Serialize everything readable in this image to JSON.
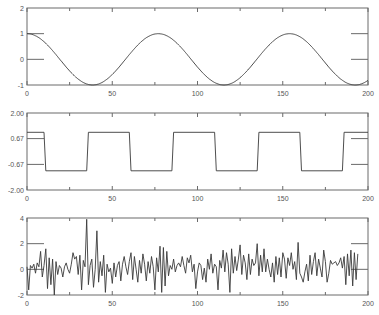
{
  "figure": {
    "background": "#ffffff",
    "frame_color": "#6a6a6a",
    "line_color": "#3a3a3a"
  },
  "chart_data": [
    {
      "type": "line",
      "title": "",
      "xlabel": "",
      "ylabel": "",
      "xlim": [
        0,
        200
      ],
      "ylim": [
        -1,
        2
      ],
      "x_ticks": [
        0,
        50,
        100,
        150,
        200
      ],
      "x_tick_labels": [
        "0",
        "50",
        "100",
        "150",
        "200"
      ],
      "y_ticks": [
        -1,
        0,
        1,
        2
      ],
      "y_tick_labels": [
        "-1",
        "0",
        "1",
        "2"
      ],
      "grid": false,
      "legend": null,
      "series": [
        {
          "name": "cosine",
          "function": "cos(2*pi*x/77)",
          "amplitude": 1,
          "period": 77,
          "x": [
            0,
            19,
            38,
            58,
            77,
            96,
            115,
            135,
            154,
            173,
            192,
            200
          ],
          "values": [
            1,
            0,
            -1,
            0,
            1,
            0,
            -1,
            0,
            1,
            0,
            -1,
            -0.8
          ]
        }
      ]
    },
    {
      "type": "line",
      "title": "",
      "xlabel": "",
      "ylabel": "",
      "xlim": [
        0,
        200
      ],
      "ylim": [
        -2,
        2
      ],
      "x_ticks": [
        0,
        50,
        100,
        150,
        200
      ],
      "x_tick_labels": [
        "0",
        "50",
        "100",
        "150",
        "200"
      ],
      "y_ticks": [
        -2,
        -0.67,
        0.67,
        2
      ],
      "y_tick_labels": [
        "-2.00",
        "-0.67",
        "0.67",
        "2.00"
      ],
      "grid": false,
      "legend": null,
      "series": [
        {
          "name": "square",
          "high": 1,
          "low": -1,
          "period": 50,
          "x": [
            0,
            10,
            11,
            35,
            36,
            60,
            61,
            85,
            86,
            110,
            111,
            135,
            136,
            160,
            161,
            185,
            186,
            200
          ],
          "values": [
            1,
            1,
            -1,
            -1,
            1,
            1,
            -1,
            -1,
            1,
            1,
            -1,
            -1,
            1,
            1,
            -1,
            -1,
            1,
            1
          ]
        }
      ]
    },
    {
      "type": "line",
      "title": "",
      "xlabel": "",
      "ylabel": "",
      "xlim": [
        0,
        200
      ],
      "ylim": [
        -2,
        4
      ],
      "x_ticks": [
        0,
        50,
        100,
        150,
        200
      ],
      "x_tick_labels": [
        "0",
        "50",
        "100",
        "150",
        "200"
      ],
      "y_ticks": [
        -2,
        0,
        2,
        4
      ],
      "y_tick_labels": [
        "-2",
        "0",
        "2",
        "4"
      ],
      "grid": false,
      "legend": null,
      "series": [
        {
          "name": "noise",
          "x": [
            0,
            1,
            2,
            3,
            4,
            5,
            6,
            7,
            8,
            9,
            10,
            11,
            12,
            13,
            14,
            15,
            16,
            17,
            18,
            19,
            20,
            21,
            22,
            23,
            24,
            25,
            26,
            27,
            28,
            29,
            30,
            31,
            32,
            33,
            34,
            35,
            36,
            37,
            38,
            39,
            40,
            41,
            42,
            43,
            44,
            45,
            46,
            47,
            48,
            49,
            50,
            51,
            52,
            53,
            54,
            55,
            56,
            57,
            58,
            59,
            60,
            61,
            62,
            63,
            64,
            65,
            66,
            67,
            68,
            69,
            70,
            71,
            72,
            73,
            74,
            75,
            76,
            77,
            78,
            79,
            80,
            81,
            82,
            83,
            84,
            85,
            86,
            87,
            88,
            89,
            90,
            91,
            92,
            93,
            94,
            95,
            96,
            97,
            98,
            99,
            100,
            101,
            102,
            103,
            104,
            105,
            106,
            107,
            108,
            109,
            110,
            111,
            112,
            113,
            114,
            115,
            116,
            117,
            118,
            119,
            120,
            121,
            122,
            123,
            124,
            125,
            126,
            127,
            128,
            129,
            130,
            131,
            132,
            133,
            134,
            135,
            136,
            137,
            138,
            139,
            140,
            141,
            142,
            143,
            144,
            145,
            146,
            147,
            148,
            149,
            150,
            151,
            152,
            153,
            154,
            155,
            156,
            157,
            158,
            159,
            160,
            161,
            162,
            163,
            164,
            165,
            166,
            167,
            168,
            169,
            170,
            171,
            172,
            173,
            174,
            175,
            176,
            177,
            178,
            179,
            180,
            181,
            182,
            183,
            184,
            185,
            186,
            187,
            188,
            189,
            190,
            191,
            192,
            193,
            194,
            195,
            196,
            197,
            198,
            199,
            200
          ],
          "values": [
            0.2,
            -1.6,
            0.3,
            0.1,
            0.4,
            -0.3,
            0.5,
            0.2,
            1.4,
            -0.6,
            0.3,
            1.6,
            -1.5,
            0.9,
            -1.2,
            0.8,
            -2.0,
            0.6,
            -0.4,
            0.3,
            0.1,
            -0.6,
            0.2,
            0.5,
            0.0,
            -0.3,
            0.4,
            1.3,
            0.8,
            1.0,
            -0.4,
            1.1,
            -1.6,
            0.7,
            0.2,
            3.9,
            -1.2,
            0.3,
            0.8,
            -1.4,
            0.0,
            3.0,
            -1.0,
            0.6,
            -0.5,
            1.1,
            -1.8,
            0.4,
            -0.2,
            0.1,
            -1.1,
            0.5,
            -0.6,
            0.3,
            0.6,
            -0.9,
            0.4,
            1.0,
            0.2,
            -0.4,
            0.6,
            1.3,
            -0.8,
            1.0,
            0.0,
            -1.0,
            0.7,
            -0.3,
            1.2,
            0.4,
            -0.9,
            0.6,
            -0.3,
            1.0,
            0.2,
            -1.6,
            0.9,
            -0.2,
            1.8,
            -1.8,
            1.7,
            -1.3,
            1.4,
            -0.5,
            0.3,
            0.0,
            0.8,
            -0.2,
            0.3,
            0.5,
            0.2,
            1.0,
            0.3,
            -0.3,
            0.9,
            0.5,
            1.1,
            -0.2,
            0.4,
            -1.5,
            -0.2,
            0.5,
            0.3,
            -0.8,
            0.1,
            -1.0,
            0.8,
            0.0,
            1.2,
            -0.3,
            0.4,
            0.2,
            -1.6,
            0.7,
            0.1,
            1.5,
            -0.2,
            1.3,
            0.4,
            -1.8,
            1.6,
            -0.3,
            1.0,
            -0.1,
            0.8,
            1.9,
            -0.4,
            1.1,
            0.5,
            -0.8,
            1.2,
            -0.4,
            0.8,
            0.3,
            0.5,
            2.0,
            -0.5,
            1.1,
            -0.2,
            1.6,
            -0.2,
            0.8,
            0.0,
            -0.6,
            0.5,
            -1.0,
            1.0,
            -0.4,
            0.9,
            -0.6,
            1.3,
            0.8,
            -0.7,
            0.9,
            0.3,
            1.3,
            0.0,
            0.6,
            -0.8,
            2.1,
            -0.3,
            -0.6,
            -1.0,
            -0.2,
            0.4,
            -0.9,
            1.1,
            -0.4,
            0.6,
            1.3,
            -0.5,
            0.8,
            0.1,
            -0.6,
            1.5,
            0.6,
            -1.0,
            -0.3,
            0.7,
            0.4,
            0.5,
            0.6,
            0.3,
            0.5,
            0.9,
            0.1,
            1.0,
            -1.2,
            1.2,
            -0.5,
            1.5,
            -1.3,
            1.3,
            -0.8,
            1.2
          ]
        }
      ]
    }
  ]
}
